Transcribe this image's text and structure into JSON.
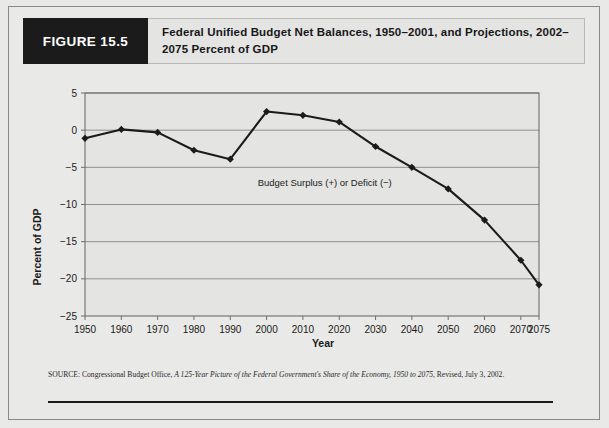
{
  "figure": {
    "tag": "FIGURE 15.5",
    "title": "Federal Unified Budget Net Balances, 1950–2001, and Projections, 2002–2075 Percent of GDP"
  },
  "source": {
    "prefix": "SOURCE: Congressional Budget Office, ",
    "italic_title": "A 125-Year Picture of the Federal Government's Share of the Economy, 1950 to 2075",
    "suffix": ", Revised, July 3, 2002."
  },
  "colors": {
    "page_background": "#e9e9e7",
    "plot_background": "#e4e4e2",
    "series_line": "#1b1b1b",
    "gridline": "#8f8f8d",
    "axis": "#6e6e6c",
    "tag_background": "#1b1b1b",
    "tag_text": "#ffffff"
  },
  "chart_data": {
    "type": "line",
    "title": "Federal Unified Budget Net Balances, 1950–2001, and Projections, 2002–2075 Percent of GDP",
    "xlabel": "Year",
    "ylabel": "Percent of GDP",
    "x": [
      1950,
      1960,
      1970,
      1980,
      1990,
      2000,
      2010,
      2020,
      2030,
      2040,
      2050,
      2060,
      2070,
      2075
    ],
    "values": [
      -1.1,
      0.1,
      -0.3,
      -2.7,
      -3.9,
      2.5,
      2.0,
      1.1,
      -2.2,
      -5.0,
      -7.9,
      -12.1,
      -17.5,
      -20.8
    ],
    "series": [
      {
        "name": "Budget Surplus (+) or Deficit (−)",
        "values": [
          -1.1,
          0.1,
          -0.3,
          -2.7,
          -3.9,
          2.5,
          2.0,
          1.1,
          -2.2,
          -5.0,
          -7.9,
          -12.1,
          -17.5,
          -20.8
        ]
      }
    ],
    "xtick_labels": [
      "1950",
      "1960",
      "1970",
      "1980",
      "1990",
      "2000",
      "2010",
      "2020",
      "2030",
      "2040",
      "2050",
      "2060",
      "2070",
      "2075"
    ],
    "ytick_labels": [
      "5",
      "0",
      "−5",
      "−10",
      "−15",
      "−20",
      "−25"
    ],
    "yticks": [
      5,
      0,
      -5,
      -10,
      -15,
      -20,
      -25
    ],
    "ylim": [
      -25,
      5
    ],
    "xlim": [
      1950,
      2075
    ],
    "grid": "horizontal",
    "legend": "none",
    "annotations": [
      {
        "text": "Budget Surplus (+) or Deficit (−)",
        "x": 2016,
        "y": -7.5
      }
    ],
    "marker": "diamond"
  }
}
